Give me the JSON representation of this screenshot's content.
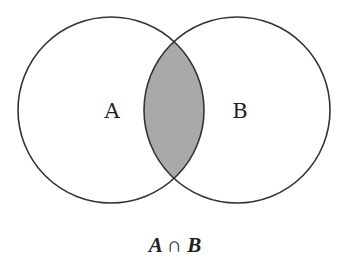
{
  "diagram": {
    "type": "venn",
    "sets": [
      {
        "id": "A",
        "label": "A",
        "cx": 111,
        "cy": 110,
        "r": 93
      },
      {
        "id": "B",
        "label": "B",
        "cx": 237,
        "cy": 110,
        "r": 93
      }
    ],
    "shaded_region": "intersection",
    "caption": "A ∩ B",
    "colors": {
      "stroke": "#333333",
      "fill_intersection": "#a9a9a9",
      "background": "#ffffff"
    }
  }
}
